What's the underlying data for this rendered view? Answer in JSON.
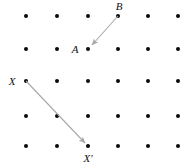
{
  "figure": {
    "background_color": "#ffffff",
    "width": 196,
    "height": 166,
    "lattice": {
      "dot_color": "#0a0a0a",
      "dot_radius": 2,
      "columns": 6,
      "rows": 5,
      "x_positions": [
        26,
        57,
        88,
        118,
        148,
        178
      ],
      "y_positions": [
        16,
        49,
        81,
        116,
        146
      ]
    },
    "vectors": [
      {
        "name": "vector-b-to-a",
        "from_label": "B",
        "to_label": "A",
        "x1": 118,
        "y1": 16,
        "x2": 92,
        "y2": 45,
        "color": "#a8a8a8"
      },
      {
        "name": "vector-x-to-xprime",
        "from_label": "X",
        "to_label": "X′",
        "x1": 26,
        "y1": 81,
        "x2": 85,
        "y2": 143,
        "color": "#a8a8a8"
      }
    ],
    "labels": [
      {
        "name": "label-b",
        "text": "B",
        "x": 119,
        "y": 10
      },
      {
        "name": "label-a",
        "text": "A",
        "x": 75,
        "y": 53
      },
      {
        "name": "label-x",
        "text": "X",
        "x": 12,
        "y": 79
      },
      {
        "name": "label-x-prime",
        "text": "X′",
        "x": 84,
        "y": 161
      }
    ]
  }
}
